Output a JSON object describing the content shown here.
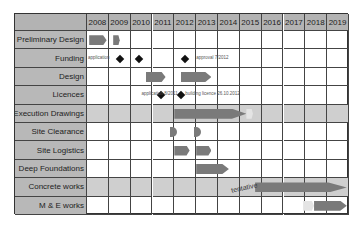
{
  "chart_data": {
    "type": "gantt",
    "title": "",
    "years": [
      "2008",
      "2009",
      "2010",
      "2011",
      "2012",
      "2013",
      "2014",
      "2015",
      "2016",
      "2017",
      "2018",
      "2019"
    ],
    "rows": [
      {
        "label": "Preliminary Design",
        "shaded": false,
        "bars": [
          {
            "start": 2008.1,
            "end": 2008.9
          },
          {
            "start": 2009.2,
            "end": 2009.5
          }
        ],
        "milestones": [],
        "notes": []
      },
      {
        "label": "Funding",
        "shaded": false,
        "bars": [],
        "milestones": [
          2009.5,
          2010.4,
          2012.5
        ],
        "notes": [
          {
            "text": "application",
            "at": 2008.05
          },
          {
            "text": "approval 7/2012",
            "at": 2013.0
          }
        ]
      },
      {
        "label": "Design",
        "shaded": false,
        "bars": [
          {
            "start": 2010.7,
            "end": 2011.6
          },
          {
            "start": 2012.3,
            "end": 2013.7
          }
        ],
        "milestones": [],
        "notes": []
      },
      {
        "label": "Licences",
        "shaded": false,
        "bars": [],
        "milestones": [
          2011.4,
          2012.3
        ],
        "notes": [
          {
            "text": "application 8/2011",
            "at": 2010.5
          },
          {
            "text": "building licence 26.10.2012",
            "at": 2012.5
          }
        ]
      },
      {
        "label": "Execution Drawings",
        "shaded": true,
        "bars": [
          {
            "start": 2012.0,
            "end": 2015.3
          },
          {
            "start": 2015.3,
            "end": 2015.6,
            "ghost": true
          }
        ],
        "milestones": [],
        "notes": []
      },
      {
        "label": "Site Clearance",
        "shaded": false,
        "bars": [
          {
            "start": 2011.8,
            "end": 2012.1,
            "round": true
          },
          {
            "start": 2012.9,
            "end": 2013.2,
            "round": true
          }
        ],
        "milestones": [],
        "notes": []
      },
      {
        "label": "Site Logistics",
        "shaded": false,
        "bars": [
          {
            "start": 2012.0,
            "end": 2012.7
          },
          {
            "start": 2013.0,
            "end": 2013.7
          }
        ],
        "milestones": [],
        "notes": []
      },
      {
        "label": "Deep Foundations",
        "shaded": false,
        "bars": [
          {
            "start": 2013.0,
            "end": 2014.5
          }
        ],
        "milestones": [],
        "notes": []
      },
      {
        "label": "Concrete works",
        "shaded": true,
        "bars": [
          {
            "start": 2015.7,
            "end": 2019.9
          }
        ],
        "milestones": [],
        "notes": [
          {
            "text": "tentative",
            "at": 2014.6
          }
        ]
      },
      {
        "label": "M & E works",
        "shaded": false,
        "bars": [
          {
            "start": 2017.9,
            "end": 2018.4,
            "ghost": true
          },
          {
            "start": 2018.4,
            "end": 2019.9
          }
        ],
        "milestones": [],
        "notes": []
      }
    ],
    "colors": {
      "bar": "#7a7a7a",
      "header": "#b3b3b3",
      "label_bg": "#b8b8b8",
      "shaded_row": "#cfcfcf",
      "milestone": "#111111"
    }
  }
}
